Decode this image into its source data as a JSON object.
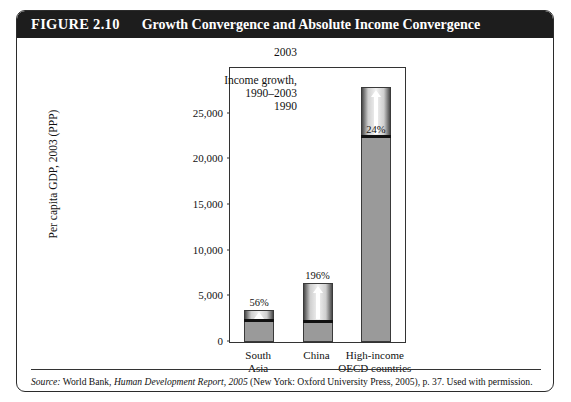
{
  "figure": {
    "label": "FIGURE 2.10",
    "title": "Growth Convergence and Absolute Income Convergence"
  },
  "source": {
    "prefix": "Source:",
    "publisher": "World Bank,",
    "report": "Human Development Report, 2005",
    "rest": "(New York: Oxford University Press, 2005), p. 37. Used with permission."
  },
  "annotations": {
    "top_year": "2003",
    "growth_line1": "Income growth,",
    "growth_line2": "1990–2003",
    "bottom_year": "1990"
  },
  "chart_data": {
    "type": "bar",
    "title": "Growth Convergence and Absolute Income Convergence",
    "xlabel": "",
    "ylabel": "Per capita GDP, 2003 (PPP)",
    "ylim": [
      0,
      30000
    ],
    "yticks": [
      0,
      5000,
      10000,
      15000,
      20000,
      25000
    ],
    "ytick_labels": [
      "0",
      "5,000",
      "10,000",
      "15,000",
      "20,000",
      "25,000"
    ],
    "grid": false,
    "legend": null,
    "categories": [
      "South Asia",
      "China",
      "High-income OECD countries"
    ],
    "category_lines": [
      [
        "South",
        "Asia"
      ],
      [
        "China",
        ""
      ],
      [
        "High-income",
        "OECD countries"
      ]
    ],
    "series": [
      {
        "name": "1990 income",
        "values": [
          2250,
          2200,
          22500
        ],
        "color": "#9a9a9a"
      },
      {
        "name": "Income growth, 1990–2003",
        "values": [
          1250,
          4300,
          5400
        ],
        "color": "#e8e8e8"
      }
    ],
    "totals_2003": [
      3500,
      6500,
      27900
    ],
    "growth_labels": [
      "56%",
      "196%",
      "24%"
    ],
    "growth_label_placement": [
      "above",
      "above",
      "inside"
    ]
  },
  "colors": {
    "title_bar": "#1d1d1d",
    "title_text": "#ffffff",
    "bar_base": "#9a9a9a",
    "bar_growth_light": "#f2f2f2",
    "frame": "#333333",
    "page": "#ffffff"
  }
}
